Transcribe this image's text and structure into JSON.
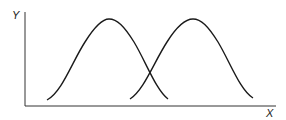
{
  "diagram": {
    "type": "two overlapping bell-shaped curves",
    "axes": {
      "y_label": "Y",
      "x_label": "X"
    },
    "curves": [
      {
        "name": "left-curve",
        "start": [
          47,
          100
        ],
        "peak": [
          109,
          19
        ],
        "end": [
          168,
          99
        ]
      },
      {
        "name": "right-curve",
        "start": [
          130,
          99
        ],
        "peak": [
          193,
          19
        ],
        "end": [
          253,
          98
        ]
      }
    ],
    "colors": {
      "line": "#1a1a1a",
      "background": "#ffffff"
    }
  }
}
